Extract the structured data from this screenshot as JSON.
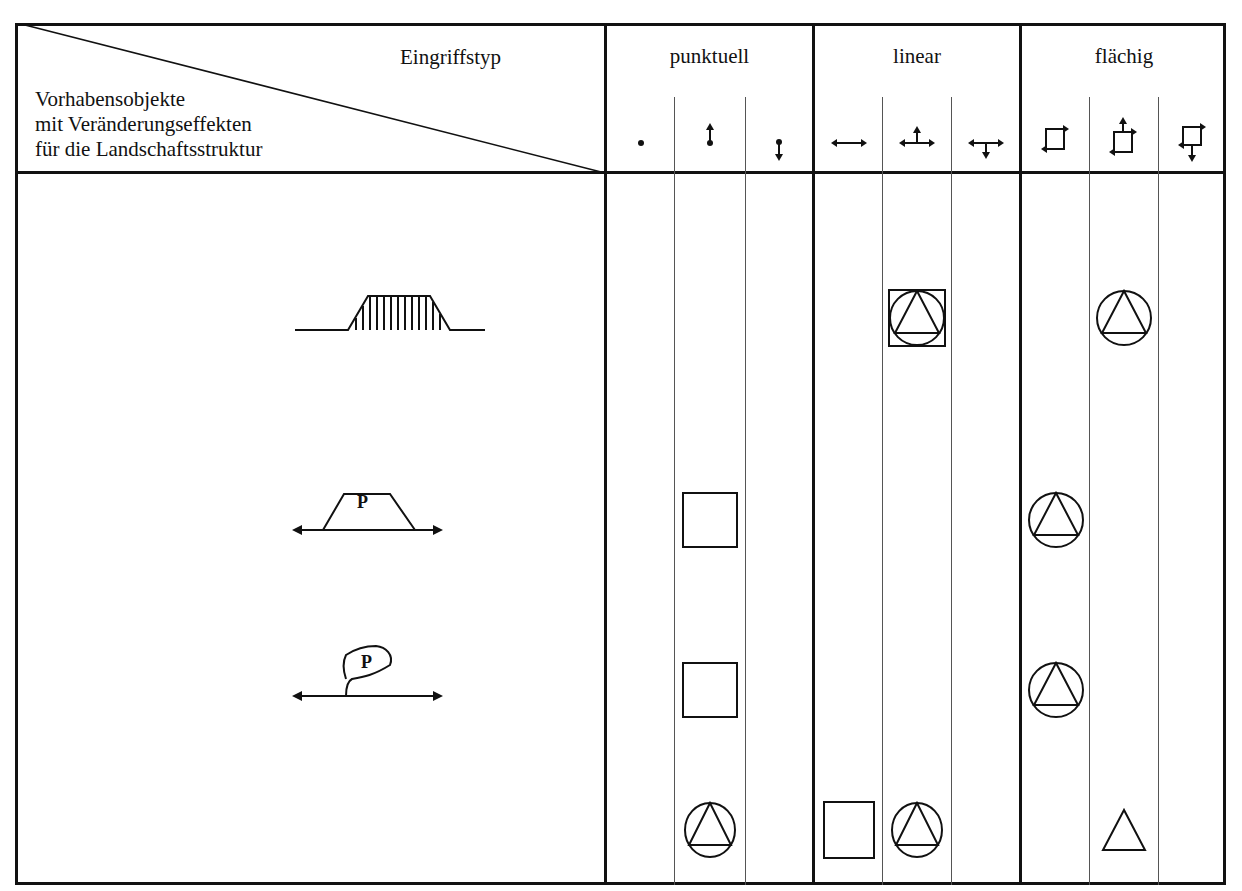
{
  "header": {
    "column_axis_label": "Eingriffstyp",
    "row_axis_label_lines": [
      "Vorhabensobjekte",
      "mit Veränderungseffekten",
      "für die Landschaftsstruktur"
    ],
    "groups": [
      {
        "label": "punktuell",
        "subcolumns": [
          {
            "icon": "dot-icon"
          },
          {
            "icon": "dot-arrow-up-icon"
          },
          {
            "icon": "dot-arrow-down-icon"
          }
        ]
      },
      {
        "label": "linear",
        "subcolumns": [
          {
            "icon": "double-arrow-horizontal-icon"
          },
          {
            "icon": "double-arrow-with-up-arrow-icon"
          },
          {
            "icon": "double-arrow-with-down-arrow-icon"
          }
        ]
      },
      {
        "label": "flächig",
        "subcolumns": [
          {
            "icon": "square-corner-arrows-icon"
          },
          {
            "icon": "square-corner-arrows-up-icon"
          },
          {
            "icon": "square-corner-arrows-down-icon"
          }
        ]
      }
    ]
  },
  "rows": [
    {
      "object_symbol": "embankment-hatched-icon",
      "object_label": "",
      "cells": [
        "",
        "",
        "",
        "",
        "circle-triangle-in-square",
        "",
        "",
        "circle-triangle",
        ""
      ]
    },
    {
      "object_symbol": "parking-trapezoid-icon",
      "object_label": "P",
      "cells": [
        "",
        "square",
        "",
        "",
        "",
        "",
        "circle-triangle",
        "",
        ""
      ]
    },
    {
      "object_symbol": "parking-loop-icon",
      "object_label": "P",
      "cells": [
        "",
        "square",
        "",
        "",
        "",
        "",
        "circle-triangle",
        "",
        ""
      ]
    },
    {
      "object_symbol": "",
      "object_label": "",
      "cells": [
        "",
        "circle-triangle",
        "",
        "square",
        "circle-triangle",
        "",
        "",
        "triangle",
        ""
      ]
    }
  ],
  "legend_symbols": {
    "square": "square",
    "circle-triangle": "triangle inscribed in circle",
    "circle-triangle-in-square": "triangle inscribed in circle inscribed in square",
    "triangle": "triangle"
  },
  "colors": {
    "ink": "#111111",
    "thin_rule": "#555555",
    "background": "#ffffff"
  }
}
